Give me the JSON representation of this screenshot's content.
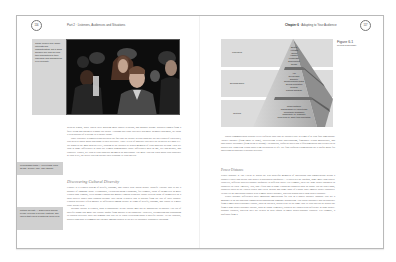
{
  "left_page": {
    "page_number": "116",
    "running_head": "Part 2 · Listeners, Audiences and Situations",
    "photo": {
      "alt": "Audience of young people watching in a dark theater",
      "caption": "These people may share interests and characteristics, but a good speaker will look beyond their similarities to their individual and background-level diversity."
    },
    "body_paragraphs_top": [
      "western region, while others were growing more public relations, and graphic design. Brothers ranged from a fully living and dating to a happy pre-death. Although this class' diversity was more thematic than most, we think it is as portrait of a college or a theatre house.",
      "Once you have recognized and accepted the fact that the people in your audience are not clones of each other, you need to know about and adapt to their diversity. Three levels of audience diversity are depicted in Figure 6.1. We begin at the most general level, looking at the cultures to which members of your audience belong. Then we look at some differences in what are termed demographic traits: differences such as age, sex and gender, and ethnicity. Finally, we look at your audience members as individuals. The more you can learn about your audience at each level, the better you can predict their response to your speech."
    ],
    "bold_term_1": "demographic traits",
    "section_heading": "Discovering Cultural Diversity",
    "body_paragraphs_bottom": [
      "Culture is a learned system of beliefs, customs, and values with which people identify. Culture also is not a product of language alone. Geographic, French-speaking Canadians, for example, think of themselves as more French than English, even though Canada has mainly English residents. Rural citizens think of themselves as a rural society rather than Spanish because they speak a dialect that is distinct from the rest of their country. Cultural diversity refers mainly to differences among people in terms of beliefs, customs, and values to a more close world-view.",
      "Because culture is learned, what is appropriate in one culture may not be appropriate in another. The list of specific things that make one culture unique from another is inexhaustible. However, recognizing and responding to cultural diversity does not demand that you try to learn everything about a specific culture. To the contrary, discovering what is common but variable among cultures is the key to culturally responsive speaking."
    ],
    "bold_term_2": "Cultural diversity",
    "side_notes": [
      "demographic traits — Fixed traits, such as age, gender, race, and ethnicity.",
      "cultural diversity — Differences among people in terms of beliefs, customs, and values that reflect a particular world view."
    ]
  },
  "right_page": {
    "page_number": "117",
    "running_head_chapter": "Chapter 6",
    "running_head_title": "Adapting to Your Audience",
    "figure": {
      "number": "Figure 6.1",
      "title": "Levels of Diversity",
      "tiers": [
        {
          "label": "Individual",
          "items": [
            "Beliefs",
            "Attitudes",
            "Values",
            "Hobbies",
            "Knowledge",
            "Experiences",
            "Needs"
          ]
        },
        {
          "label": "Demographic",
          "items": [
            "Age",
            "Sex/Gender",
            "Ethnicity",
            "Socioeconomic status",
            "Sexual orientation",
            "Religion",
            "Political affiliation"
          ]
        },
        {
          "label": "Cultural",
          "items": [
            "Power distance",
            "Individualism vs. collectivism",
            "Uncertainty avoidance",
            "Masculinity vs. femininity",
            "Long-term vs. short-term orientation"
          ]
        }
      ]
    },
    "body_paragraph_intro": "Dutch communication scholar Geert Hofstede says that all cultures vary in terms of at least four dimensions: \"power distance (from small to large), collectivism versus individualism, femininity versus masculinity, and uncertainty avoidance (from weak to strong).\" In addition, Hofstede notes that a fifth dimension has recently been discovered: long-term versus short-term orientation to life. We find Hofstede's dimensions are a useful guide for analyzing an audience's cultural diversity.",
    "section_heading": "Power Distance",
    "body_paragraphs": [
      "Power distance is \"the extent to which the less powerful members of institutions and organizations within a country expect and accept that power is distributed unequally.\" All societies are unequal, some more than others. However, different societies handle inequality in different ways. For example, there are large power distances in countries in Latin America, Asia, and Africa and in some European countries such as Spain. On the other hand, countries such as the United States and Great Britain and some parts of Europe have smaller power distances. Neither is an egalitarian country with a small power distance, whereas Russia has a large power distance.",
      "Power distance differences have important implications for you as a public speaker. Suppose you are a manager in an international organization announcing company downsizing. You could encounter that an audience from a small power-distance culture, such as Sweden, would react in the same way to your speech as would one from a large power-distance culture, such as Japan. Similarly, teachers are trained with deference in large power-distance cultures, whereas they are treated as near equals in small power-distance cultures. For example, a professor from a"
    ]
  },
  "colors": {
    "page_border": "#b9b9b9",
    "sidebar_gray": "#d0d0d0",
    "heading_gray": "#7a7a7a",
    "body_text": "#555555",
    "pyramid_dark": "#9a9a9a",
    "pyramid_light": "#c8c8c8"
  }
}
